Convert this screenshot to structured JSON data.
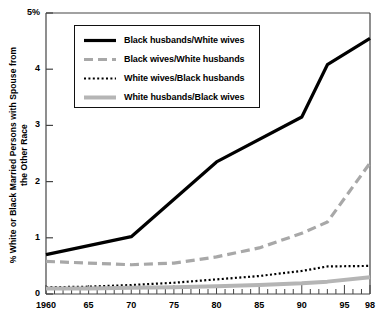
{
  "chart_data": {
    "type": "line",
    "title": "",
    "xlabel": "",
    "ylabel": "% White or Black Married Persons with Spouse from the Other Race",
    "xlim": [
      1960,
      1998
    ],
    "ylim": [
      0,
      5
    ],
    "grid": false,
    "legend_position": "upper-left-inside",
    "x_tick_labels": [
      "1960",
      "65",
      "70",
      "75",
      "80",
      "85",
      "90",
      "95",
      "98"
    ],
    "x_tick_values": [
      1960,
      1965,
      1970,
      1975,
      1980,
      1985,
      1990,
      1995,
      1998
    ],
    "y_tick_labels": [
      "0",
      "1",
      "2",
      "3",
      "4",
      "5%"
    ],
    "y_tick_values": [
      0,
      1,
      2,
      3,
      4,
      5
    ],
    "series": [
      {
        "name": "Black husbands/White wives",
        "style": "solid",
        "color": "#000000",
        "width": 3.2,
        "x": [
          1960,
          1970,
          1980,
          1990,
          1993,
          1998
        ],
        "values": [
          0.7,
          1.02,
          2.35,
          3.15,
          4.08,
          4.55
        ]
      },
      {
        "name": "Black wives/White husbands",
        "style": "dashed",
        "color": "#a8a8a8",
        "width": 3.2,
        "x": [
          1960,
          1965,
          1970,
          1975,
          1980,
          1985,
          1990,
          1993,
          1998
        ],
        "values": [
          0.58,
          0.55,
          0.52,
          0.55,
          0.66,
          0.82,
          1.08,
          1.28,
          2.33
        ]
      },
      {
        "name": "White wives/Black husbands",
        "style": "dotted",
        "color": "#000000",
        "width": 2.2,
        "x": [
          1960,
          1965,
          1970,
          1975,
          1980,
          1985,
          1990,
          1993,
          1998
        ],
        "values": [
          0.12,
          0.13,
          0.16,
          0.2,
          0.26,
          0.32,
          0.41,
          0.49,
          0.5
        ]
      },
      {
        "name": "White husbands/Black wives",
        "style": "thick-solid",
        "color": "#b5b5b5",
        "width": 4.0,
        "x": [
          1960,
          1965,
          1970,
          1975,
          1980,
          1985,
          1990,
          1993,
          1998
        ],
        "values": [
          0.1,
          0.1,
          0.11,
          0.12,
          0.14,
          0.16,
          0.19,
          0.22,
          0.3
        ]
      }
    ]
  },
  "axis": {
    "y_label": "% White or Black Married Persons with Spouse from the Other Race"
  }
}
